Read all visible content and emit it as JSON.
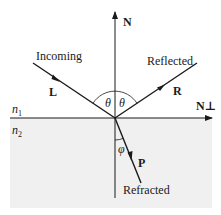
{
  "diagram": {
    "type": "reflection-refraction",
    "colors": {
      "line": "#1a1a1a",
      "lower_medium_fill": "#f0f0f0",
      "background": "#ffffff"
    },
    "labels": {
      "normal": "N",
      "normal_perp": "N⊥",
      "incoming": "Incoming",
      "reflected": "Reflected",
      "refracted": "Refracted",
      "incoming_vector": "L",
      "reflected_vector": "R",
      "refracted_vector": "P",
      "theta_left": "θ",
      "theta_right": "θ",
      "phi": "φ",
      "medium1_base": "n",
      "medium1_sub": "1",
      "medium2_base": "n",
      "medium2_sub": "2"
    }
  }
}
